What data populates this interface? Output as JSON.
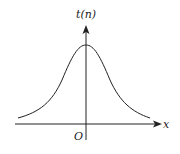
{
  "diagram": {
    "type": "bell-curve",
    "y_axis_label": "t(n)",
    "x_axis_label": "x",
    "origin_label": "O",
    "colors": {
      "stroke": "#222222",
      "background": "#ffffff"
    }
  }
}
